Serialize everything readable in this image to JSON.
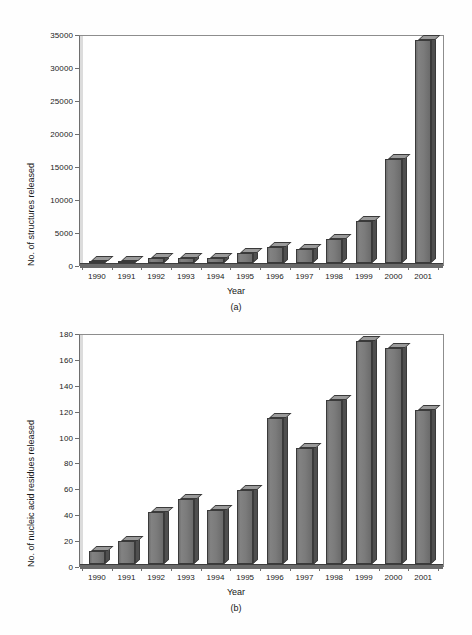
{
  "figure_a": {
    "caption": "(a)",
    "xlabel": "Year",
    "ylabel": "No. of structures released",
    "yticks": [
      "0",
      "5000",
      "10000",
      "15000",
      "20000",
      "25000",
      "30000",
      "35000"
    ],
    "xticks": [
      "1990",
      "1991",
      "1992",
      "1993",
      "1994",
      "1995",
      "1996",
      "1997",
      "1998",
      "1999",
      "2000",
      "2001"
    ]
  },
  "figure_b": {
    "caption": "(b)",
    "xlabel": "Year",
    "ylabel": "No. of nucleic acid residues released",
    "yticks": [
      "0",
      "20",
      "40",
      "60",
      "80",
      "100",
      "120",
      "140",
      "160",
      "180"
    ],
    "xticks": [
      "1990",
      "1991",
      "1992",
      "1993",
      "1994",
      "1995",
      "1996",
      "1997",
      "1998",
      "1999",
      "2000",
      "2001"
    ]
  },
  "colors": {
    "bar_front": "#767676",
    "bar_top": "#9a9a9a",
    "bar_side": "#4f4f4f",
    "bar_outline": "#3a3a3a",
    "axis": "#6e6e6e",
    "text": "#161616",
    "background": "#ffffff"
  },
  "chart_data": [
    {
      "type": "bar",
      "id": "a",
      "title": "(a)",
      "xlabel": "Year",
      "ylabel": "No. of structures released",
      "categories": [
        "1990",
        "1991",
        "1992",
        "1993",
        "1994",
        "1995",
        "1996",
        "1997",
        "1998",
        "1999",
        "2000",
        "2001"
      ],
      "values": [
        300,
        350,
        800,
        800,
        700,
        1500,
        2500,
        2100,
        3700,
        6400,
        15800,
        33800
      ],
      "ylim": [
        0,
        35000
      ],
      "ytick_step": 5000,
      "grid": false,
      "legend": "none",
      "style": "3d-column"
    },
    {
      "type": "bar",
      "id": "b",
      "title": "(b)",
      "xlabel": "Year",
      "ylabel": "No. of nucleic acid residues released",
      "categories": [
        "1990",
        "1991",
        "1992",
        "1993",
        "1994",
        "1995",
        "1996",
        "1997",
        "1998",
        "1999",
        "2000",
        "2001"
      ],
      "values": [
        10,
        18,
        40,
        50,
        42,
        57,
        113,
        90,
        127,
        172,
        167,
        119
      ],
      "ylim": [
        0,
        180
      ],
      "ytick_step": 20,
      "grid": false,
      "legend": "none",
      "style": "3d-column"
    }
  ]
}
